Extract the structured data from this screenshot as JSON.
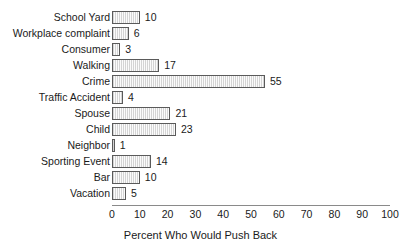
{
  "chart_data": {
    "type": "bar",
    "orientation": "horizontal",
    "title": "",
    "subtitle": "",
    "xlabel": "Percent Who Would Push Back",
    "ylabel": "",
    "xlim": [
      0,
      100
    ],
    "xticks": [
      0,
      10,
      20,
      30,
      40,
      50,
      60,
      70,
      80,
      90,
      100
    ],
    "xtick_labels": [
      "0",
      "10",
      "20",
      "30",
      "40",
      "50",
      "60",
      "70",
      "80",
      "90",
      "100"
    ],
    "grid": false,
    "legend": false,
    "legend_position": "none",
    "value_labels": true,
    "categories": [
      "School Yard",
      "Workplace complaint",
      "Consumer",
      "Walking",
      "Crime",
      "Traffic Accident",
      "Spouse",
      "Child",
      "Neighbor",
      "Sporting Event",
      "Bar",
      "Vacation"
    ],
    "values": [
      10,
      6,
      3,
      17,
      55,
      4,
      21,
      23,
      1,
      14,
      10,
      5
    ],
    "value_label_texts": [
      "10",
      "6",
      "3",
      "17",
      "55",
      "4",
      "21",
      "23",
      "1",
      "14",
      "10",
      "5"
    ],
    "series": [
      {
        "name": "Percent Who Would Push Back",
        "values": [
          10,
          6,
          3,
          17,
          55,
          4,
          21,
          23,
          1,
          14,
          10,
          5
        ]
      }
    ],
    "colors": {
      "bar_fill": "#d4d4d4",
      "bar_fill_alt": "#fbfbfb",
      "bar_border": "#5a5a5a",
      "axis_line": "#8a8a8a",
      "text": "#1a1a1a",
      "background": "#ffffff"
    },
    "bar_pattern": "vertical-hatch"
  }
}
